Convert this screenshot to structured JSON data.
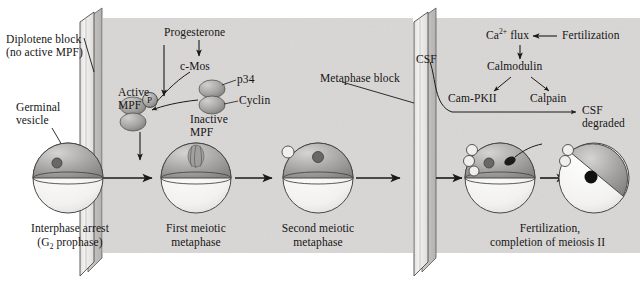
{
  "figure": {
    "background_shade": "#d9d7d5",
    "panel_fill": "#e9e7e5",
    "ink": "#1a1a1a"
  },
  "barriers": [
    {
      "name": "diplotene-barrier",
      "label": "Diplotene block",
      "sublabel": "(no active MPF)"
    },
    {
      "name": "metaphase-barrier",
      "label": "Metaphase block",
      "sublabel": "CSF"
    }
  ],
  "labels": {
    "diplotene_block": "Diplotene block",
    "no_active_mpf": "(no active MPF)",
    "germinal_vesicle_l1": "Germinal",
    "germinal_vesicle_l2": "vesicle",
    "progesterone": "Progesterone",
    "c_mos": "c-Mos",
    "active_mpf_l1": "Active",
    "active_mpf_l2": "MPF",
    "phospho": "P",
    "p34": "p34",
    "cyclin": "Cyclin",
    "inactive_mpf_l1": "Inactive",
    "inactive_mpf_l2": "MPF",
    "metaphase_block": "Metaphase block",
    "csf": "CSF",
    "ca_flux": "Ca",
    "ca_flux_sup": "2+",
    "ca_flux_rest": " flux",
    "fertilization": "Fertilization",
    "calmodulin": "Calmodulin",
    "cam_pkii": "Cam-PKII",
    "calpain": "Calpain",
    "csf_degraded_l1": "CSF",
    "csf_degraded_l2": "degraded"
  },
  "stages": [
    {
      "name": "stage-interphase-arrest",
      "line1": "Interphase arrest",
      "line2_pre": "(G",
      "line2_sub": "2",
      "line2_post": " prophase)"
    },
    {
      "name": "stage-first-meiotic-metaphase",
      "line1": "First meiotic",
      "line2": "metaphase"
    },
    {
      "name": "stage-second-meiotic-metaphase",
      "line1": "Second meiotic",
      "line2": "metaphase"
    },
    {
      "name": "stage-fertilization",
      "line1": "Fertilization,",
      "line2": "completion of meiosis II"
    }
  ],
  "cells": [
    {
      "name": "oocyte-germinal-vesicle",
      "cx": 68,
      "features": "germinal vesicle nucleus"
    },
    {
      "name": "oocyte-meiosis-i-spindle",
      "cx": 196,
      "features": "meiotic spindle"
    },
    {
      "name": "oocyte-meiosis-ii",
      "cx": 318,
      "features": "one polar body, nucleus"
    },
    {
      "name": "oocyte-fertilized",
      "cx": 500,
      "features": "two polar bodies, sperm entering"
    },
    {
      "name": "oocyte-zygote",
      "cx": 594,
      "features": "fused pronucleus"
    }
  ]
}
